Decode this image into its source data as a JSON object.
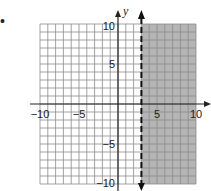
{
  "bullet": "•",
  "chart_data": {
    "type": "inequality-graph",
    "title": "",
    "xlabel": "",
    "ylabel": "y",
    "xlim": [
      -10,
      10
    ],
    "ylim": [
      -10,
      10
    ],
    "grid": true,
    "grid_step": 1,
    "x_ticks": [
      {
        "value": -10,
        "label": "−10"
      },
      {
        "value": -5,
        "label": "−5"
      },
      {
        "value": 5,
        "label": "5"
      },
      {
        "value": 10,
        "label": "10"
      }
    ],
    "y_ticks": [
      {
        "value": 10,
        "label": "10"
      },
      {
        "value": 5,
        "label": "5"
      },
      {
        "value": -5,
        "label": "−5"
      },
      {
        "value": -10,
        "label": "−10"
      }
    ],
    "boundary": {
      "type": "vertical",
      "x": 3,
      "style": "dashed",
      "arrows": "both"
    },
    "shaded_region": {
      "inequality": "x > 3",
      "side": "right"
    },
    "colors": {
      "grid": "#8a8a8a",
      "axis": "#222222",
      "shade": "#b5b5b5",
      "boundary": "#111111"
    }
  }
}
